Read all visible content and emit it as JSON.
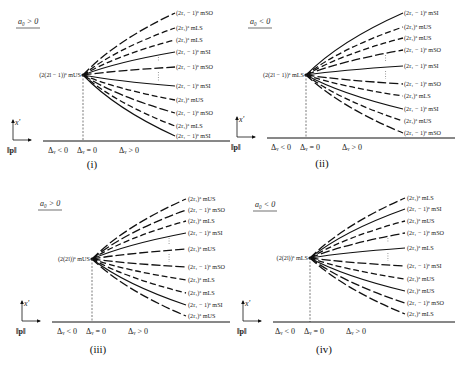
{
  "figure": {
    "panels": [
      {
        "id": "i",
        "caption": "(i)",
        "sign_label": "a₀ > 0",
        "center_label": "(2(2l − 1))ᵃ mUS",
        "axis": {
          "x_label": "‖p‖",
          "y_label": "x'",
          "regions": [
            "Δᵥ < 0",
            "Δᵥ = 0",
            "Δᵥ > 0"
          ]
        },
        "branches": [
          {
            "label": "(2r₁ − 1)ᵃ mSO",
            "style": "dash-long",
            "end_y": 13
          },
          {
            "label": "(2r₁)ᵃ mLS",
            "style": "dash",
            "end_y": 28
          },
          {
            "label": "(2r₁)ᵃ mLS",
            "style": "dash",
            "end_y": 40
          },
          {
            "label": "(2r₁ − 1)ᵃ mSI",
            "style": "solid",
            "end_y": 52
          },
          {
            "label": "(2r₁ − 1)ᵃ mSO",
            "style": "dash-long",
            "end_y": 67
          },
          {
            "label": "(2r₁ − 1)ᵃ mSI",
            "style": "solid",
            "end_y": 86
          },
          {
            "label": "(2r₁)ᵃ mUS",
            "style": "dash",
            "end_y": 100
          },
          {
            "label": "(2r₁ − 1)ᵃ mSO",
            "style": "dash-long",
            "end_y": 113
          },
          {
            "label": "(2r₁)ᵃ mLS",
            "style": "dash",
            "end_y": 126
          },
          {
            "label": "(2r₁ − 1)ᵃ mSI",
            "style": "solid",
            "end_y": 136
          }
        ]
      },
      {
        "id": "ii",
        "caption": "(ii)",
        "sign_label": "a₀ < 0",
        "center_label": "(2(2l − 1))ᵃ mLS",
        "axis": {
          "x_label": "‖p‖",
          "y_label": "x'",
          "regions": [
            "Δᵥ < 0",
            "Δᵥ = 0",
            "Δᵥ > 0"
          ]
        },
        "branches": [
          {
            "label": "(2r₁ − 1)ᵃ mSI",
            "style": "solid",
            "end_y": 13
          },
          {
            "label": "(2r₁)ᵃ mUS",
            "style": "dash",
            "end_y": 27
          },
          {
            "label": "(2r₁)ᵃ mUS",
            "style": "dash",
            "end_y": 38
          },
          {
            "label": "(2r₁ − 1)ᵃ mSO",
            "style": "dash-long",
            "end_y": 50
          },
          {
            "label": "(2r₁ − 1)ᵃ mSI",
            "style": "solid",
            "end_y": 66
          },
          {
            "label": "(2r₁ − 1)ᵃ mSO",
            "style": "dash-long",
            "end_y": 84
          },
          {
            "label": "(2r₁)ᵃ mLS",
            "style": "dash",
            "end_y": 96
          },
          {
            "label": "(2r₁ − 1)ᵃ mSI",
            "style": "solid",
            "end_y": 109
          },
          {
            "label": "(2r₁)ᵃ mUS",
            "style": "dash",
            "end_y": 121
          },
          {
            "label": "(2r₁ − 1)ᵃ mSO",
            "style": "dash-long",
            "end_y": 133
          }
        ]
      },
      {
        "id": "iii",
        "caption": "(iii)",
        "sign_label": "a₀ > 0",
        "center_label": "(2(2l))ᵃ mUS",
        "axis": {
          "x_label": "‖p‖",
          "y_label": "x'",
          "regions": [
            "Δᵥ < 0",
            "Δᵥ = 0",
            "Δᵥ > 0"
          ]
        },
        "branches": [
          {
            "label": "(2r₁)ᵃ mUS",
            "style": "dash-long",
            "end_y": 199
          },
          {
            "label": "(2r₁ − 1)ᵃ mSO",
            "style": "dash-long",
            "end_y": 210
          },
          {
            "label": "(2r₁)ᵃ mLS",
            "style": "dash",
            "end_y": 221
          },
          {
            "label": "(2r₁ − 1)ᵃ mSI",
            "style": "solid",
            "end_y": 233
          },
          {
            "label": "(2r₁)ᵃ mUS",
            "style": "dash-long",
            "end_y": 249
          },
          {
            "label": "(2r₁ − 1)ᵃ mSO",
            "style": "dash-long",
            "end_y": 267
          },
          {
            "label": "(2r₁)ᵃ mLS",
            "style": "dash",
            "end_y": 280
          },
          {
            "label": "(2r₁)ᵃ mLS",
            "style": "dash",
            "end_y": 293
          },
          {
            "label": "(2r₁ − 1)ᵃ mSI",
            "style": "solid",
            "end_y": 305
          },
          {
            "label": "(2r₁)ᵃ mUS",
            "style": "dash-long",
            "end_y": 316
          }
        ]
      },
      {
        "id": "iv",
        "caption": "(iv)",
        "sign_label": "a₀ < 0",
        "center_label": "(2(2l))ᵃ mLS",
        "axis": {
          "x_label": "‖p‖",
          "y_label": "x'",
          "regions": [
            "Δᵥ < 0",
            "Δᵥ = 0",
            "Δᵥ > 0"
          ]
        },
        "branches": [
          {
            "label": "(2r₁)ᵃ mLS",
            "style": "dash-long",
            "end_y": 198
          },
          {
            "label": "(2r₁ − 1)ᵃ mSI",
            "style": "solid",
            "end_y": 209
          },
          {
            "label": "(2r₁)ᵃ mUS",
            "style": "dash",
            "end_y": 221
          },
          {
            "label": "(2r₁ − 1)ᵃ mSO",
            "style": "dash-long",
            "end_y": 233
          },
          {
            "label": "(2r₁)ᵃ mLS",
            "style": "solid",
            "end_y": 248
          },
          {
            "label": "(2r₁ − 1)ᵃ mSI",
            "style": "dash-long",
            "end_y": 266
          },
          {
            "label": "(2r₁)ᵃ mUS",
            "style": "dash",
            "end_y": 279
          },
          {
            "label": "(2r₁)ᵃ mUS",
            "style": "solid",
            "end_y": 291
          },
          {
            "label": "(2r₁ − 1)ᵃ mSO",
            "style": "dash-long",
            "end_y": 303
          },
          {
            "label": "(2r₁)ᵃ mLS",
            "style": "dash-long",
            "end_y": 314
          }
        ]
      }
    ]
  }
}
